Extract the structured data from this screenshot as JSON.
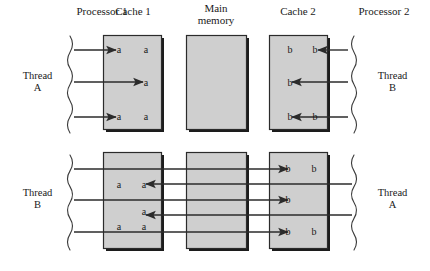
{
  "diagram": {
    "colors": {
      "box_fill": "#cfcfcf",
      "box_stroke": "#2b2b2b",
      "box_shadow": "#1c1c1c",
      "arrow": "#2b2b2b",
      "brace": "#3a3a3a",
      "text": "#1a1a1a",
      "background": "#ffffff"
    },
    "headers": [
      {
        "id": "processor-1",
        "text": "Processor 1",
        "x": 63,
        "y": 5,
        "w": 78
      },
      {
        "id": "cache-1",
        "text": "Cache 1",
        "x": 103,
        "y": 5,
        "w": 60
      },
      {
        "id": "main-memory",
        "text": "Main\nmemory",
        "line1": "Main",
        "line2": "memory",
        "x": 186,
        "y": 0,
        "w": 60
      },
      {
        "id": "cache-2",
        "text": "Cache 2",
        "x": 268,
        "y": 5,
        "w": 60
      },
      {
        "id": "processor-2",
        "text": "Processor 2",
        "x": 345,
        "y": 5,
        "w": 78
      }
    ],
    "thread_labels": [
      {
        "id": "top-left",
        "line1": "Thread",
        "line2": "A",
        "x": 10,
        "y": 70
      },
      {
        "id": "top-right",
        "line1": "Thread",
        "line2": "B",
        "x": 365,
        "y": 70
      },
      {
        "id": "bottom-left",
        "line1": "Thread",
        "line2": "B",
        "x": 10,
        "y": 187
      },
      {
        "id": "bottom-right",
        "line1": "Thread",
        "line2": "A",
        "x": 365,
        "y": 187
      }
    ],
    "boxes": [
      {
        "id": "cache-1-top",
        "x": 103,
        "y": 35,
        "w": 58,
        "h": 94
      },
      {
        "id": "main-memory-top",
        "x": 186,
        "y": 35,
        "w": 60,
        "h": 94
      },
      {
        "id": "cache-2-top",
        "x": 269,
        "y": 35,
        "w": 58,
        "h": 94
      },
      {
        "id": "cache-1-bottom",
        "x": 103,
        "y": 152,
        "w": 58,
        "h": 96
      },
      {
        "id": "main-memory-bottom",
        "x": 186,
        "y": 152,
        "w": 60,
        "h": 96
      },
      {
        "id": "cache-2-bottom",
        "x": 269,
        "y": 152,
        "w": 58,
        "h": 96
      }
    ],
    "cells_top": [
      {
        "id": "c1-a-r1a",
        "text": "a",
        "x": 114,
        "y": 44
      },
      {
        "id": "c1-a-r1b",
        "text": "a",
        "x": 141,
        "y": 44
      },
      {
        "id": "c1-a-r2",
        "text": "a",
        "x": 141,
        "y": 77
      },
      {
        "id": "c1-a-r3a",
        "text": "a",
        "x": 114,
        "y": 111
      },
      {
        "id": "c1-a-r3b",
        "text": "a",
        "x": 141,
        "y": 111
      },
      {
        "id": "c2-b-r1a",
        "text": "b",
        "x": 285,
        "y": 44
      },
      {
        "id": "c2-b-r1b",
        "text": "b",
        "x": 310,
        "y": 44
      },
      {
        "id": "c2-b-r2",
        "text": "b",
        "x": 285,
        "y": 77
      },
      {
        "id": "c2-b-r3a",
        "text": "b",
        "x": 285,
        "y": 111
      },
      {
        "id": "c2-b-r3b",
        "text": "b",
        "x": 310,
        "y": 111
      }
    ],
    "cells_bottom": [
      {
        "id": "c1-a-b1a",
        "text": "a",
        "x": 114,
        "y": 179
      },
      {
        "id": "c1-a-b1b",
        "text": "a",
        "x": 139,
        "y": 179
      },
      {
        "id": "c1-a-b2",
        "text": "a",
        "x": 139,
        "y": 206
      },
      {
        "id": "c1-a-b3a",
        "text": "a",
        "x": 114,
        "y": 221
      },
      {
        "id": "c1-a-b3b",
        "text": "a",
        "x": 139,
        "y": 221
      },
      {
        "id": "c2-b-b1a",
        "text": "b",
        "x": 283,
        "y": 163
      },
      {
        "id": "c2-b-b1b",
        "text": "b",
        "x": 309,
        "y": 163
      },
      {
        "id": "c2-b-b2",
        "text": "b",
        "x": 283,
        "y": 194
      },
      {
        "id": "c2-b-b3a",
        "text": "b",
        "x": 283,
        "y": 226
      },
      {
        "id": "c2-b-b3b",
        "text": "b",
        "x": 309,
        "y": 226
      }
    ],
    "arrows_top": [
      {
        "id": "p1-to-c1-1",
        "x1": 74,
        "y": 50,
        "x2": 116,
        "dir": "right"
      },
      {
        "id": "p1-to-c1-2",
        "x1": 74,
        "y": 82,
        "x2": 143,
        "dir": "right"
      },
      {
        "id": "p1-to-c1-3",
        "x1": 74,
        "y": 117,
        "x2": 116,
        "dir": "right"
      },
      {
        "id": "p2-to-c2-1",
        "x1": 348,
        "y": 50,
        "x2": 318,
        "dir": "left"
      },
      {
        "id": "p2-to-c2-2",
        "x1": 348,
        "y": 82,
        "x2": 292,
        "dir": "left"
      },
      {
        "id": "p2-to-c2-3",
        "x1": 348,
        "y": 117,
        "x2": 292,
        "dir": "left"
      }
    ],
    "arrows_bottom": [
      {
        "id": "p1-to-c2-1",
        "x1": 74,
        "y": 169,
        "x2": 288,
        "dir": "right"
      },
      {
        "id": "c2-to-c1-1",
        "x1": 352,
        "y": 184,
        "x2": 146,
        "dir": "left"
      },
      {
        "id": "p1-to-c2-2",
        "x1": 74,
        "y": 200,
        "x2": 288,
        "dir": "right"
      },
      {
        "id": "c2-to-c1-2",
        "x1": 352,
        "y": 215,
        "x2": 146,
        "dir": "left"
      },
      {
        "id": "p1-to-c2-3",
        "x1": 74,
        "y": 232,
        "x2": 288,
        "dir": "right"
      }
    ],
    "braces": [
      {
        "id": "brace-top-left",
        "x": 70,
        "y1": 36,
        "y2": 133,
        "side": "left"
      },
      {
        "id": "brace-top-right",
        "x": 354,
        "y1": 36,
        "y2": 133,
        "side": "right"
      },
      {
        "id": "brace-bottom-left",
        "x": 70,
        "y1": 155,
        "y2": 250,
        "side": "left"
      },
      {
        "id": "brace-bottom-right",
        "x": 354,
        "y1": 155,
        "y2": 250,
        "side": "right"
      }
    ]
  }
}
